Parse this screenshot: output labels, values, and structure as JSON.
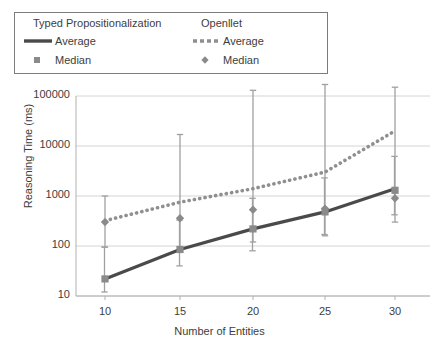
{
  "chart_data": {
    "type": "line",
    "title": "",
    "xlabel": "Number of Entities",
    "ylabel": "Reasoning Time (ms)",
    "yscale": "log",
    "ylim": [
      10,
      100000
    ],
    "ytick_labels": [
      "10",
      "100",
      "1000",
      "10000",
      "100000"
    ],
    "ytick_values": [
      10,
      100,
      1000,
      10000,
      100000
    ],
    "grid": true,
    "legend_position": "top-left-inside",
    "categories": [
      10,
      15,
      20,
      25,
      30
    ],
    "xtick_labels": [
      "10",
      "15",
      "20",
      "25",
      "30"
    ],
    "series": [
      {
        "name": "Typed Propositionalization Average",
        "group": "Typed Propositionalization",
        "stat": "Average",
        "style": "solid",
        "color": "#4a4a4a",
        "values": [
          22,
          85,
          220,
          480,
          1400
        ]
      },
      {
        "name": "Typed Propositionalization Median",
        "group": "Typed Propositionalization",
        "stat": "Median",
        "style": "square-marker",
        "color": "#8a8a8a",
        "values": [
          22,
          85,
          220,
          480,
          1300
        ],
        "err_low": [
          12,
          40,
          80,
          170,
          420
        ],
        "err_high": [
          95,
          330,
          900,
          2300,
          6200
        ]
      },
      {
        "name": "Openllet Average",
        "group": "Openllet",
        "stat": "Average",
        "style": "dotted",
        "color": "#8f8f8f",
        "values": [
          320,
          750,
          1400,
          3000,
          20000
        ]
      },
      {
        "name": "Openllet Median",
        "group": "Openllet",
        "stat": "Median",
        "style": "diamond-marker",
        "color": "#8a8a8a",
        "values": [
          300,
          360,
          530,
          560,
          900
        ],
        "err_low": [
          95,
          85,
          120,
          160,
          300
        ],
        "err_high": [
          1000,
          17000,
          130000,
          170000,
          150000
        ]
      }
    ]
  },
  "legend": {
    "col1_title": "Typed Propositionalization",
    "col2_title": "Openllet",
    "col1_row1_label": "Average",
    "col1_row2_label": "Median",
    "col2_row1_label": "Average",
    "col2_row2_label": "Median"
  },
  "colors": {
    "solid_line": "#4a4a4a",
    "dotted_line": "#8f8f8f",
    "marker": "#8a8a8a",
    "errorbar": "#a0a0a0",
    "grid": "#d4d4d4",
    "axis": "#b0b0b0",
    "text": "#3d3d3d"
  }
}
